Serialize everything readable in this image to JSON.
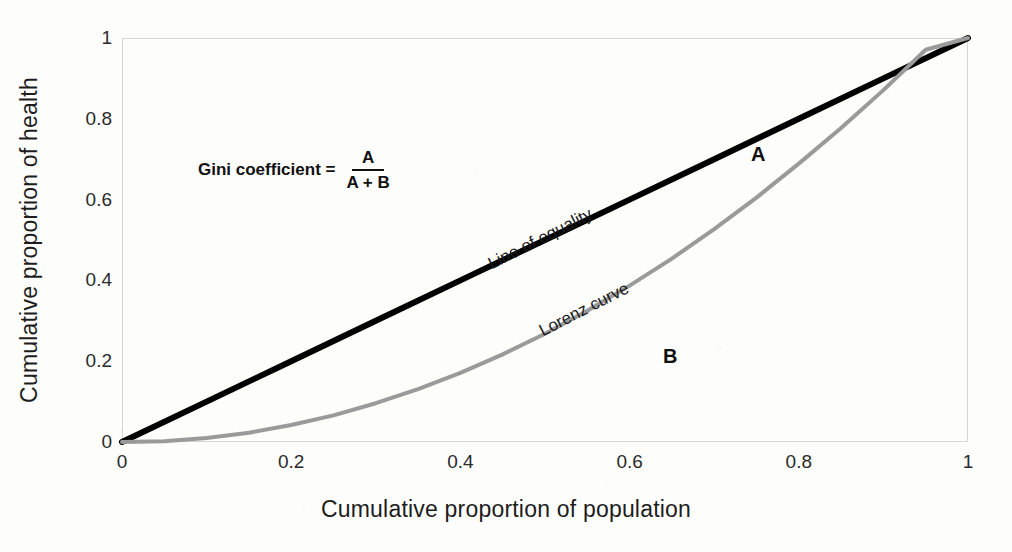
{
  "chart_data": {
    "type": "line",
    "title": "",
    "xlabel": "Cumulative proportion of population",
    "ylabel": "Cumulative proportion of health",
    "xlim": [
      0,
      1
    ],
    "ylim": [
      0,
      1
    ],
    "grid": false,
    "legend_position": "inline-annotations",
    "xticks": [
      "0",
      "0.2",
      "0.4",
      "0.6",
      "0.8",
      "1"
    ],
    "xtick_values": [
      0,
      0.2,
      0.4,
      0.6,
      0.8,
      1
    ],
    "yticks": [
      "0",
      "0.2",
      "0.4",
      "0.6",
      "0.8",
      "1"
    ],
    "ytick_values": [
      0,
      0.2,
      0.4,
      0.6,
      0.8,
      1
    ],
    "series": [
      {
        "name": "Line of equality",
        "color": "#000000",
        "linewidth": 6,
        "x": [
          0,
          0.1,
          0.2,
          0.3,
          0.4,
          0.5,
          0.6,
          0.7,
          0.8,
          0.9,
          1
        ],
        "values": [
          0,
          0.1,
          0.2,
          0.3,
          0.4,
          0.5,
          0.6,
          0.7,
          0.8,
          0.9,
          1
        ]
      },
      {
        "name": "Lorenz curve",
        "color": "#9a9a9a",
        "linewidth": 4,
        "x": [
          0,
          0.05,
          0.1,
          0.15,
          0.2,
          0.25,
          0.3,
          0.35,
          0.4,
          0.45,
          0.5,
          0.55,
          0.6,
          0.65,
          0.7,
          0.75,
          0.8,
          0.85,
          0.9,
          0.95,
          1
        ],
        "values": [
          0,
          0.002,
          0.01,
          0.023,
          0.042,
          0.066,
          0.096,
          0.131,
          0.171,
          0.217,
          0.268,
          0.325,
          0.387,
          0.454,
          0.527,
          0.605,
          0.689,
          0.777,
          0.871,
          0.971,
          1
        ]
      }
    ],
    "annotations": [
      {
        "id": "line-of-equality-label",
        "text": "Line of equality",
        "x": 0.44,
        "y": 0.465,
        "rotation": -27
      },
      {
        "id": "lorenz-curve-label",
        "text": "Lorenz curve",
        "x": 0.5,
        "y": 0.3,
        "rotation": -27
      },
      {
        "id": "region-a-label",
        "text": "A",
        "x": 0.752,
        "y": 0.712
      },
      {
        "id": "region-b-label",
        "text": "B",
        "x": 0.648,
        "y": 0.212
      }
    ]
  },
  "formula": {
    "lhs": "Gini coefficient =",
    "numerator": "A",
    "denominator": "A + B"
  },
  "colors": {
    "equality_line": "#000000",
    "lorenz_curve": "#9a9a9a",
    "plot_border": "#d6d6d6",
    "text": "#1a1a1a",
    "background": "#fdfdfc"
  }
}
